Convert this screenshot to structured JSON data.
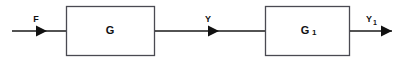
{
  "diagram": {
    "type": "block-diagram",
    "background_color": "#ffffff",
    "line_color": "#1a1a1a",
    "box_stroke_color": "#4a4a52",
    "box_fill_color": "#ffffff",
    "text_color": "#111111",
    "blocks": [
      {
        "id": "block-g",
        "label": "G",
        "subscript": "",
        "x": 66,
        "y": 6,
        "width": 89,
        "height": 50
      },
      {
        "id": "block-g1",
        "label": "G",
        "subscript": "1",
        "x": 265,
        "y": 6,
        "width": 85,
        "height": 50
      }
    ],
    "signals": [
      {
        "id": "signal-f",
        "label": "F",
        "subscript": "",
        "label_x": 36,
        "label_y": 22,
        "line_y": 31,
        "line_x1": 12,
        "line_x2": 66,
        "arrow_x": 46
      },
      {
        "id": "signal-y",
        "label": "Y",
        "subscript": "",
        "label_x": 208,
        "label_y": 22,
        "line_y": 31,
        "line_x1": 155,
        "line_x2": 265,
        "arrow_x": 218
      },
      {
        "id": "signal-y1",
        "label": "Y",
        "subscript": "1",
        "label_x": 370,
        "label_y": 22,
        "line_y": 31,
        "line_x1": 350,
        "line_x2": 392,
        "arrow_x": 392
      }
    ]
  }
}
